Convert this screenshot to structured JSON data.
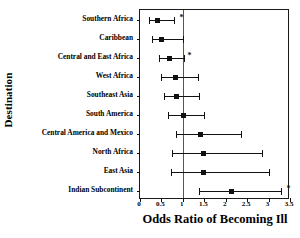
{
  "chart_data": {
    "type": "scatter",
    "subtype": "forest-plot",
    "title": "",
    "xlabel": "Odds Ratio of Becoming Ill",
    "ylabel": "Destination",
    "xlim": [
      0,
      3.5
    ],
    "xticks": [
      0,
      0.5,
      1,
      1.5,
      2,
      2.5,
      3,
      3.5
    ],
    "xticklabels": [
      "0",
      "0.5",
      "1",
      "1.5",
      "2",
      "2.5",
      "3",
      "3.5"
    ],
    "grid": false,
    "legend": null,
    "reference_line": 1,
    "significance_marker": "*",
    "categories": [
      "Southern Africa",
      "Caribbean",
      "Central and East Africa",
      "West Africa",
      "Southeast Asia",
      "South America",
      "Central America and Mexico",
      "North Africa",
      "East Asia",
      "Indian Subcontinent"
    ],
    "points": [
      {
        "label": "Southern Africa",
        "odds_ratio": 0.4,
        "ci_low": 0.2,
        "ci_high": 0.8,
        "starred": true,
        "star_x": 0.92
      },
      {
        "label": "Caribbean",
        "odds_ratio": 0.5,
        "ci_low": 0.27,
        "ci_high": 1.0,
        "starred": false,
        "star_x": null
      },
      {
        "label": "Central and East Africa",
        "odds_ratio": 0.67,
        "ci_low": 0.45,
        "ci_high": 1.02,
        "starred": true,
        "star_x": 1.11
      },
      {
        "label": "West Africa",
        "odds_ratio": 0.82,
        "ci_low": 0.5,
        "ci_high": 1.35,
        "starred": false,
        "star_x": null
      },
      {
        "label": "Southeast Asia",
        "odds_ratio": 0.85,
        "ci_low": 0.55,
        "ci_high": 1.37,
        "starred": false,
        "star_x": null
      },
      {
        "label": "South America",
        "odds_ratio": 1.0,
        "ci_low": 0.65,
        "ci_high": 1.5,
        "starred": false,
        "star_x": null
      },
      {
        "label": "Central America and Mexico",
        "odds_ratio": 1.4,
        "ci_low": 0.85,
        "ci_high": 2.35,
        "starred": false,
        "star_x": null
      },
      {
        "label": "North Africa",
        "odds_ratio": 1.47,
        "ci_low": 0.75,
        "ci_high": 2.85,
        "starred": false,
        "star_x": null
      },
      {
        "label": "East Asia",
        "odds_ratio": 1.47,
        "ci_low": 0.72,
        "ci_high": 3.0,
        "starred": false,
        "star_x": null
      },
      {
        "label": "Indian Subcontinent",
        "odds_ratio": 2.13,
        "ci_low": 1.37,
        "ci_high": 3.3,
        "starred": true,
        "star_x": 3.42
      }
    ]
  },
  "colors": {
    "marker": "#111111",
    "whisker": "#111111",
    "frame": "#1a1a1a",
    "reference_line": "#555555",
    "background": "#ffffff",
    "text": "#000000"
  }
}
